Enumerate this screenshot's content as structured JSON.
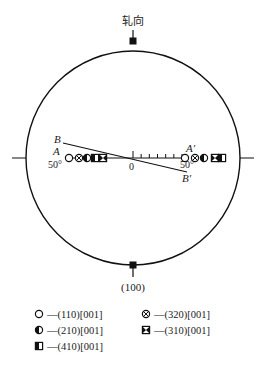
{
  "figure": {
    "top_label": "轧向",
    "bottom_label": "(100)",
    "line_labels": {
      "B": "B",
      "A": "A",
      "A_prime": "A′",
      "B_prime": "B′",
      "left_angle": "50°",
      "right_angle": "50°",
      "origin": "0"
    },
    "scale_ticks_count": 7,
    "symbols_row": [
      {
        "type": "open-circle",
        "side": "left"
      },
      {
        "type": "cross-circle",
        "side": "left"
      },
      {
        "type": "half-circle",
        "side": "left"
      },
      {
        "type": "half-square",
        "side": "left"
      },
      {
        "type": "bowtie-square",
        "side": "left"
      },
      {
        "type": "open-circle",
        "side": "right"
      },
      {
        "type": "cross-circle",
        "side": "right"
      },
      {
        "type": "half-circle",
        "side": "right"
      },
      {
        "type": "bowtie-square",
        "side": "right"
      },
      {
        "type": "half-square",
        "side": "right"
      }
    ]
  },
  "legend": [
    {
      "symbol": "open-circle",
      "label": "—(110)[001]"
    },
    {
      "symbol": "cross-circle",
      "label": "—(320)[001]"
    },
    {
      "symbol": "half-circle",
      "label": "—(210)[001]"
    },
    {
      "symbol": "bowtie-square",
      "label": "—(310)[001]"
    },
    {
      "symbol": "half-square",
      "label": "—(410)[001]"
    }
  ]
}
